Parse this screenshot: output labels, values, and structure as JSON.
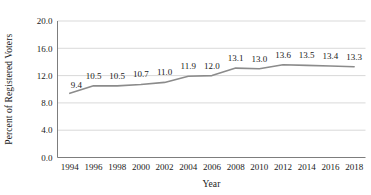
{
  "chart_data": {
    "type": "line",
    "title": "",
    "subtitle": "",
    "xlabel": "Year",
    "ylabel": "Percent of Registered Voters",
    "categories": [
      1994,
      1996,
      1998,
      2000,
      2002,
      2004,
      2006,
      2008,
      2010,
      2012,
      2014,
      2016,
      2018
    ],
    "x_tick_labels": [
      "1994",
      "1996",
      "1998",
      "2000",
      "2002",
      "2004",
      "2006",
      "2008",
      "2010",
      "2012",
      "2014",
      "2016",
      "2018"
    ],
    "values": [
      9.4,
      10.5,
      10.5,
      10.7,
      11.0,
      11.9,
      12.0,
      13.1,
      13.0,
      13.6,
      13.5,
      13.4,
      13.3
    ],
    "data_labels": [
      "9.4",
      "10.5",
      "10.5",
      "10.7",
      "11.0",
      "11.9",
      "12.0",
      "13.1",
      "13.0",
      "13.6",
      "13.5",
      "13.4",
      "13.3"
    ],
    "ylim": [
      0.0,
      20.0
    ],
    "y_ticks": [
      0.0,
      4.0,
      8.0,
      12.0,
      16.0,
      20.0
    ],
    "y_tick_labels": [
      "0.0",
      "4.0",
      "8.0",
      "12.0",
      "16.0",
      "20.0"
    ],
    "grid": "horizontal",
    "legend": "none",
    "series": [
      {
        "name": "Percent of Registered Voters",
        "color": "#8b8b8b",
        "values": [
          9.4,
          10.5,
          10.5,
          10.7,
          11.0,
          11.9,
          12.0,
          13.1,
          13.0,
          13.6,
          13.5,
          13.4,
          13.3
        ]
      }
    ],
    "colors": {
      "line": "#8b8b8b",
      "gridline": "#c8c8c8",
      "axis": "#6e6e6e",
      "text": "#1a1a1a",
      "background": "#ffffff"
    }
  }
}
